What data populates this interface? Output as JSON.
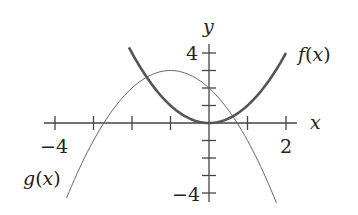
{
  "chart_data": {
    "type": "line",
    "title": "",
    "xlabel": "x",
    "ylabel": "y",
    "xlim": [
      -4,
      2
    ],
    "ylim": [
      -4,
      4
    ],
    "x_tick_labels": [
      "-4",
      "2"
    ],
    "y_tick_labels": [
      "4",
      "-4"
    ],
    "x_ticks": [
      -4,
      -3,
      -2,
      -1,
      0,
      1,
      2
    ],
    "y_ticks": [
      -4,
      -3,
      -2,
      -1,
      0,
      1,
      2,
      3,
      4
    ],
    "grid": false,
    "series": [
      {
        "name": "f(x)",
        "style": "thick",
        "formula": "x^2",
        "x": [
          -2.08,
          -1.5,
          -1,
          -0.5,
          0,
          0.5,
          1,
          1.5,
          2
        ],
        "y": [
          4.33,
          2.25,
          1,
          0.25,
          0,
          0.25,
          1,
          2.25,
          4
        ]
      },
      {
        "name": "g(x)",
        "style": "thin",
        "formula": "-(x+1)^2+3",
        "x": [
          -3.7,
          -3,
          -2.73,
          -2,
          -1,
          0,
          0.73,
          1,
          1.75
        ],
        "y": [
          -4.29,
          -1,
          0,
          2,
          3,
          2,
          0,
          -1,
          -4.56
        ]
      }
    ]
  },
  "labels": {
    "x_axis": "x",
    "y_axis": "y",
    "x_min": "−4",
    "x_max": "2",
    "y_max": "4",
    "y_min": "−4",
    "f_label_name": "f",
    "f_label_open": "(",
    "f_label_var": "x",
    "f_label_close": ")",
    "g_label_name": "g",
    "g_label_open": "(",
    "g_label_var": "x",
    "g_label_close": ")"
  }
}
